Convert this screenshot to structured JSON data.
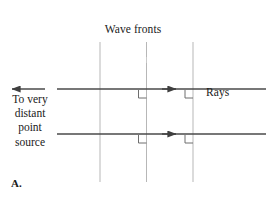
{
  "figure": {
    "panel_label": "A.",
    "labels": {
      "wavefronts": "Wave fronts",
      "source": "To very\ndistant\npoint\nsource",
      "rays": "Rays"
    },
    "colors": {
      "ray_stroke": "#4a4a4a",
      "wavefront_stroke": "#b7b7b7",
      "right_angle_stroke": "#6e6e6e",
      "text": "#1a1a1a",
      "background": "#ffffff"
    },
    "geometry": {
      "wavefront_x": [
        100,
        146.5,
        193
      ],
      "wavefront_top_y": 42,
      "wavefront_bottom_y": 182,
      "ray_y": [
        89,
        134
      ],
      "ray_start_x": 57,
      "ray_end_x": 266,
      "ray_arrow_x": 176,
      "source_arrow_tip_x": 9,
      "source_arrow_tail_x": 45,
      "right_angle_size": 8
    },
    "elements": {
      "wavefront_count": 3,
      "ray_count": 2,
      "right_angle_marks": 4,
      "direction_arrows": 3
    }
  }
}
